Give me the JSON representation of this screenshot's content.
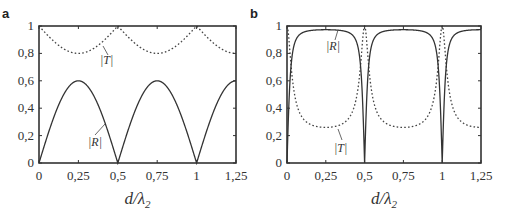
{
  "chart_data": [
    {
      "type": "line",
      "panel_label": "a",
      "xlabel": "d/λ2",
      "ylabel": "",
      "xlim": [
        0,
        1.25
      ],
      "ylim": [
        0,
        1
      ],
      "x_ticks": [
        "0",
        "0,25",
        "0,5",
        "0,75",
        "1",
        "1,25"
      ],
      "y_ticks": [
        "0",
        "0,2",
        "0,4",
        "0,6",
        "0,8",
        "1"
      ],
      "grid": false,
      "series": [
        {
          "name": "|T|",
          "style": "dotted",
          "x": [
            0,
            0.125,
            0.25,
            0.375,
            0.5,
            0.625,
            0.75,
            0.875,
            1.0,
            1.125,
            1.25
          ],
          "values": [
            1.0,
            0.86,
            0.8,
            0.86,
            1.0,
            0.86,
            0.8,
            0.86,
            1.0,
            0.86,
            0.8
          ]
        },
        {
          "name": "|R|",
          "style": "solid",
          "x": [
            0,
            0.125,
            0.25,
            0.375,
            0.5,
            0.625,
            0.75,
            0.875,
            1.0,
            1.125,
            1.25
          ],
          "values": [
            0,
            0.45,
            0.6,
            0.45,
            0,
            0.45,
            0.6,
            0.45,
            0,
            0.45,
            0.6
          ]
        }
      ]
    },
    {
      "type": "line",
      "panel_label": "b",
      "xlabel": "d/λ2",
      "ylabel": "",
      "xlim": [
        0,
        1.25
      ],
      "ylim": [
        0,
        1
      ],
      "x_ticks": [
        "0",
        "0,25",
        "0,5",
        "0,75",
        "1",
        "1,25"
      ],
      "y_ticks": [
        "0",
        "0,2",
        "0,4",
        "0,6",
        "0,8",
        "1"
      ],
      "grid": false,
      "series": [
        {
          "name": "|R|",
          "style": "solid",
          "x": [
            0,
            0.02,
            0.05,
            0.125,
            0.25,
            0.375,
            0.45,
            0.48,
            0.5,
            0.52,
            0.55,
            0.75,
            0.95,
            0.98,
            1.0,
            1.02,
            1.05,
            1.25
          ],
          "values": [
            0,
            0.75,
            0.9,
            0.96,
            0.98,
            0.96,
            0.9,
            0.75,
            0,
            0.75,
            0.9,
            0.98,
            0.9,
            0.75,
            0,
            0.75,
            0.9,
            0.98
          ]
        },
        {
          "name": "|T|",
          "style": "dotted",
          "x": [
            0,
            0.02,
            0.05,
            0.125,
            0.25,
            0.375,
            0.45,
            0.48,
            0.5,
            0.52,
            0.55,
            0.75,
            0.95,
            0.98,
            1.0,
            1.02,
            1.05,
            1.25
          ],
          "values": [
            1,
            0.66,
            0.43,
            0.27,
            0.2,
            0.27,
            0.43,
            0.66,
            1,
            0.66,
            0.43,
            0.2,
            0.43,
            0.66,
            1,
            0.66,
            0.43,
            0.2
          ]
        }
      ]
    }
  ],
  "labels": {
    "a": "a",
    "b": "b",
    "xlabel": "d/λ",
    "xlabel_sub": "2",
    "T": "|T|",
    "R": "|R|"
  }
}
